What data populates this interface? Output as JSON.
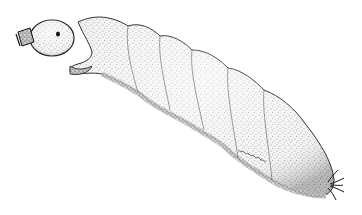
{
  "illustration": {
    "subject": "insect larva stipple drawing",
    "style": "black ink stippling on white",
    "colors": {
      "background": "#ffffff",
      "ink": "#1a1a1a",
      "body_fill": "#f2f2f2"
    },
    "parts": [
      "head-capsule",
      "mouthparts",
      "prothorax",
      "body-segments",
      "posterior-tip",
      "terminal-filaments",
      "artist-signature"
    ]
  }
}
